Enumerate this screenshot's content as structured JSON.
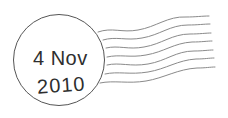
{
  "postmark": {
    "date_line_1": "4 Nov",
    "date_line_2": "2010",
    "ink_color": "#555555",
    "wave_line_count": 7
  }
}
